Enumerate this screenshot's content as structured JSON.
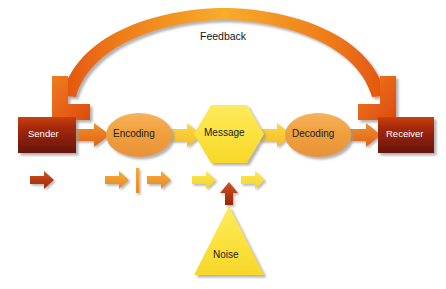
{
  "diagram": {
    "background_color": "#ffffff",
    "feedback": {
      "label": "Feedback",
      "label_x": 200,
      "label_y": 37,
      "arc_color_left": "#e8541a",
      "arc_color_mid": "#f5a623",
      "arc_color_right": "#e8541a"
    },
    "nodes": [
      {
        "id": "sender",
        "label": "Sender",
        "shape": "rectangle",
        "x": 18,
        "y": 117,
        "width": 58,
        "height": 36,
        "fill_top": "#c03b10",
        "fill_bottom": "#6e1508",
        "text_color": "#ffffff"
      },
      {
        "id": "encoding",
        "label": "Encoding",
        "shape": "ellipse",
        "cx": 139,
        "cy": 135,
        "rx": 33,
        "ry": 22,
        "fill": "#f0a040",
        "text_color": "#1a1a1a"
      },
      {
        "id": "message",
        "label": "Message",
        "shape": "hexagon",
        "cx": 229,
        "cy": 134,
        "rx": 35,
        "ry": 29,
        "fill": "#fbe13c",
        "text_color": "#1a1a1a"
      },
      {
        "id": "decoding",
        "label": "Decoding",
        "shape": "ellipse",
        "cx": 318,
        "cy": 135,
        "rx": 33,
        "ry": 22,
        "fill": "#f0a040",
        "text_color": "#1a1a1a"
      },
      {
        "id": "receiver",
        "label": "Receiver",
        "shape": "rectangle",
        "x": 378,
        "y": 117,
        "width": 56,
        "height": 36,
        "fill_top": "#c03b10",
        "fill_bottom": "#6e1508",
        "text_color": "#ffffff"
      },
      {
        "id": "noise",
        "label": "Noise",
        "shape": "triangle",
        "cx": 229,
        "cy": 255,
        "half_width": 35,
        "height": 62,
        "fill": "#fbe13c",
        "text_color": "#1a1a1a"
      }
    ],
    "connectors": [
      {
        "id": "sender-to-encoding",
        "from": "sender",
        "to": "encoding",
        "color": "#e8701e"
      },
      {
        "id": "encoding-to-message",
        "from": "encoding",
        "to": "message",
        "color": "#f5b429"
      },
      {
        "id": "message-to-decoding",
        "from": "message",
        "to": "decoding",
        "color": "#f5b429"
      },
      {
        "id": "decoding-to-receiver",
        "from": "decoding",
        "to": "receiver",
        "color": "#e8701e"
      }
    ],
    "accent_markers": [
      {
        "id": "marker-1",
        "kind": "arrow-right",
        "x": 30,
        "y": 179,
        "color": "#b83c10",
        "width": 22
      },
      {
        "id": "marker-2",
        "kind": "arrow-right",
        "x": 105,
        "y": 179,
        "color": "#f0952a",
        "width": 22
      },
      {
        "id": "marker-3",
        "kind": "bar",
        "x": 137,
        "y": 179,
        "color": "#f0952a",
        "width": 3
      },
      {
        "id": "marker-4",
        "kind": "arrow-right",
        "x": 145,
        "y": 179,
        "color": "#f0952a",
        "width": 22
      },
      {
        "id": "marker-5",
        "kind": "arrow-right",
        "x": 192,
        "y": 179,
        "color": "#fbe13c",
        "width": 22
      },
      {
        "id": "marker-6",
        "kind": "arrow-up",
        "x": 229,
        "y": 185,
        "color": "#b8300c",
        "width": 16
      },
      {
        "id": "marker-7",
        "kind": "arrow-right",
        "x": 240,
        "y": 179,
        "color": "#fbe13c",
        "width": 22
      }
    ],
    "colors": {
      "orange_dark": "#e8541a",
      "orange_light": "#f5a623",
      "yellow": "#fbe13c",
      "maroon": "#6e1508",
      "shadow": "#b0b0b0"
    }
  }
}
